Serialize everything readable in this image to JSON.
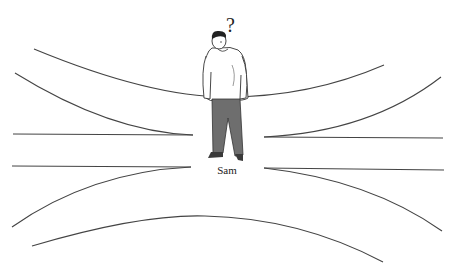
{
  "figure": {
    "name_label": "Sam",
    "thought_symbol": "?"
  },
  "colors": {
    "line": "#444444",
    "trousers": "#6e6e6e",
    "shoes": "#3a3a3a",
    "hair": "#222222",
    "outline": "#333333",
    "background": "#ffffff"
  }
}
